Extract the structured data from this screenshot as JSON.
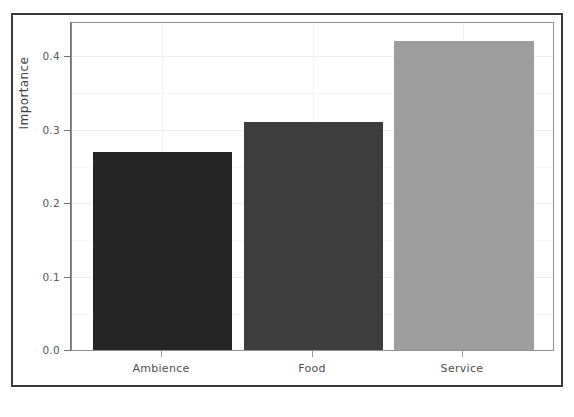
{
  "chart_data": {
    "type": "bar",
    "title": "",
    "subtitle": "",
    "xlabel": "",
    "ylabel": "Importance",
    "categories": [
      "Ambience",
      "Food",
      "Service"
    ],
    "values": [
      0.27,
      0.31,
      0.42
    ],
    "series": [
      {
        "name": "Importance",
        "values": [
          0.27,
          0.31,
          0.42
        ]
      }
    ],
    "bar_colors": [
      "#262626",
      "#3d3d3d",
      "#9e9e9e"
    ],
    "ylim": [
      0.0,
      0.44
    ],
    "yticks": [
      0.0,
      0.1,
      0.2,
      0.3,
      0.4
    ],
    "ytick_labels": [
      "0.0",
      "0.1",
      "0.2",
      "0.3",
      "0.4"
    ],
    "grid": true,
    "grid_color": "#ededed",
    "legend": "none",
    "panel_border_color": "#8f8f8f",
    "background": "#ffffff"
  },
  "axes": {
    "y_title": "Importance",
    "y_tick_labels": [
      "0.4",
      "0.3",
      "0.2",
      "0.1",
      "0.0"
    ],
    "x_tick_labels": [
      "Ambience",
      "Food",
      "Service"
    ]
  },
  "frame": {
    "border_color": "#3b3b3b"
  }
}
